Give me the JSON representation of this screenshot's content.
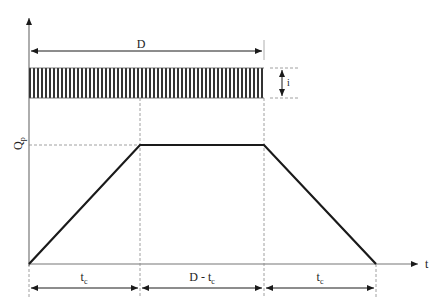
{
  "diagram": {
    "labels": {
      "duration": "D",
      "intensity": "i",
      "peak_flow": "Q",
      "peak_flow_sub": "p",
      "time_axis": "t",
      "rise_time": "t",
      "rise_time_sub": "c",
      "plateau": "D - t",
      "plateau_sub": "c",
      "recession_time": "t",
      "recession_time_sub": "c"
    },
    "colors": {
      "line": "#1a1a1a",
      "axis": "#777777",
      "dashed": "#888888",
      "hatch": "#333333"
    },
    "geometry": {
      "origin": [
        29,
        264
      ],
      "peak_start": [
        140,
        145
      ],
      "peak_end": [
        264,
        145
      ],
      "end": [
        376,
        264
      ],
      "rain_band": {
        "x0": 29,
        "x1": 264,
        "y0": 68,
        "y1": 98
      }
    }
  }
}
